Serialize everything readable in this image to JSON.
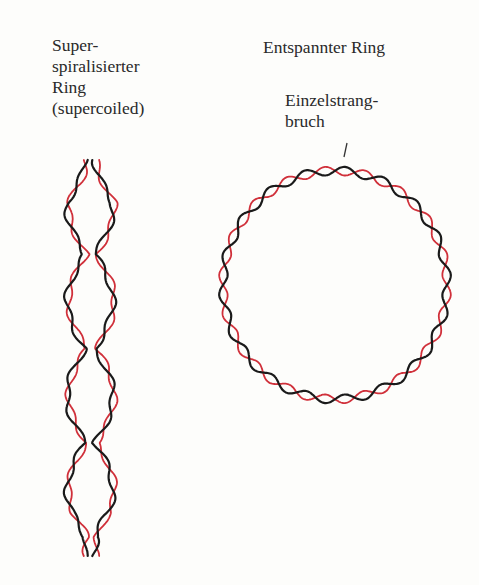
{
  "labels": {
    "supercoiled": "Super-\nspiralisierter\nRing\n(supercoiled)",
    "relaxed": "Entspannter Ring",
    "nick": "Einzelstrang-\nbruch"
  },
  "colors": {
    "strand_a": "#1a1a1a",
    "strand_b": "#d0303a",
    "background": "#fdfdfb"
  },
  "figure": {
    "left": {
      "name": "supercoiled-plasmid",
      "x_range": [
        63,
        117
      ],
      "y_range": [
        160,
        556
      ]
    },
    "right": {
      "name": "relaxed-circular-plasmid",
      "cx": 335,
      "cy": 285,
      "r": 112,
      "twists": 18,
      "nick_at": [
        343,
        148
      ]
    }
  }
}
